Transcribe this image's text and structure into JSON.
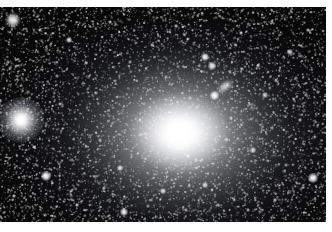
{
  "image": {
    "kind": "astronomical-photograph",
    "subject": "giant elliptical galaxy with surrounding star field",
    "alt_text": "Black-and-white astronomical photograph of a bright diffuse elliptical galaxy centered slightly right of middle, surrounded by a dense field of stars, with a small edge-on companion galaxy at upper right and a brilliant spiked foreground star at the left edge.",
    "width": 332,
    "height": 232,
    "border_color": "#ffffff",
    "sky_color": "#020203",
    "light_color": "#ffffff"
  },
  "frame": {
    "border_top": 7,
    "border_bottom": 10,
    "border_right": 6,
    "border_left": 0,
    "plate_left": 0,
    "plate_top": 7,
    "plate_width": 326,
    "plate_height": 215
  },
  "objects": {
    "galaxy": {
      "name": "central-elliptical-galaxy",
      "center_x_pct": 55.2,
      "center_y_pct": 58.6,
      "halo_rx_pct": 62,
      "halo_ry_pct": 68,
      "core_rx_pct": 15.5,
      "core_ry_pct": 19,
      "orientation": "horizontally elongated",
      "peak_brightness": "#ffffff"
    },
    "companion_galaxy": {
      "name": "edge-on-companion-galaxy",
      "x": 212,
      "y": 80,
      "width": 26,
      "height": 13,
      "rotation_deg": -38,
      "nucleus_x": 214,
      "nucleus_y": 95,
      "nucleus_size": 9
    },
    "spiked_star": {
      "name": "bright-foreground-star",
      "x": 21,
      "y": 120,
      "glow_size": 46,
      "spike_count": 16,
      "spike_length": 62
    }
  },
  "stars": [
    {
      "x": 13,
      "y": 20,
      "r": 5.4,
      "a": 0.98,
      "fuzzy": true
    },
    {
      "x": 46,
      "y": 176,
      "r": 4.2,
      "a": 1.0,
      "fuzzy": false
    },
    {
      "x": 313,
      "y": 178,
      "r": 3.8,
      "a": 0.98,
      "fuzzy": false
    },
    {
      "x": 124,
      "y": 212,
      "r": 3.4,
      "a": 0.95,
      "fuzzy": false
    },
    {
      "x": 205,
      "y": 57,
      "r": 3.2,
      "a": 0.96,
      "fuzzy": false
    },
    {
      "x": 212,
      "y": 66,
      "r": 2.8,
      "a": 0.9,
      "fuzzy": false
    },
    {
      "x": 69,
      "y": 40,
      "r": 2.4,
      "a": 0.86,
      "fuzzy": false
    },
    {
      "x": 40,
      "y": 30,
      "r": 1.7,
      "a": 0.72,
      "fuzzy": false
    },
    {
      "x": 120,
      "y": 168,
      "r": 2.6,
      "a": 0.88,
      "fuzzy": false
    },
    {
      "x": 163,
      "y": 191,
      "r": 2.3,
      "a": 0.84,
      "fuzzy": false
    },
    {
      "x": 205,
      "y": 185,
      "r": 2.2,
      "a": 0.82,
      "fuzzy": false
    },
    {
      "x": 253,
      "y": 150,
      "r": 2.0,
      "a": 0.8,
      "fuzzy": false
    },
    {
      "x": 265,
      "y": 95,
      "r": 2.0,
      "a": 0.78,
      "fuzzy": false
    },
    {
      "x": 290,
      "y": 52,
      "r": 2.1,
      "a": 0.8,
      "fuzzy": false
    },
    {
      "x": 241,
      "y": 33,
      "r": 1.9,
      "a": 0.76,
      "fuzzy": false
    },
    {
      "x": 176,
      "y": 26,
      "r": 1.8,
      "a": 0.74,
      "fuzzy": false
    },
    {
      "x": 110,
      "y": 22,
      "r": 1.7,
      "a": 0.72,
      "fuzzy": false
    },
    {
      "x": 86,
      "y": 63,
      "r": 1.6,
      "a": 0.7,
      "fuzzy": false
    },
    {
      "x": 60,
      "y": 104,
      "r": 1.6,
      "a": 0.68,
      "fuzzy": false
    },
    {
      "x": 34,
      "y": 147,
      "r": 1.7,
      "a": 0.7,
      "fuzzy": false
    },
    {
      "x": 14,
      "y": 196,
      "r": 1.9,
      "a": 0.74,
      "fuzzy": false
    },
    {
      "x": 77,
      "y": 205,
      "r": 1.8,
      "a": 0.72,
      "fuzzy": false
    },
    {
      "x": 140,
      "y": 120,
      "r": 1.5,
      "a": 0.62,
      "fuzzy": false
    },
    {
      "x": 231,
      "y": 118,
      "r": 1.5,
      "a": 0.62,
      "fuzzy": false
    },
    {
      "x": 196,
      "y": 160,
      "r": 1.6,
      "a": 0.66,
      "fuzzy": false
    },
    {
      "x": 275,
      "y": 200,
      "r": 1.8,
      "a": 0.7,
      "fuzzy": false
    },
    {
      "x": 300,
      "y": 120,
      "r": 1.7,
      "a": 0.68,
      "fuzzy": false
    },
    {
      "x": 308,
      "y": 30,
      "r": 1.8,
      "a": 0.7,
      "fuzzy": false
    },
    {
      "x": 152,
      "y": 45,
      "r": 1.5,
      "a": 0.64,
      "fuzzy": false
    },
    {
      "x": 100,
      "y": 140,
      "r": 1.4,
      "a": 0.58,
      "fuzzy": false
    },
    {
      "x": 248,
      "y": 210,
      "r": 1.6,
      "a": 0.66,
      "fuzzy": false
    },
    {
      "x": 186,
      "y": 210,
      "r": 1.5,
      "a": 0.62,
      "fuzzy": false
    },
    {
      "x": 57,
      "y": 76,
      "r": 1.4,
      "a": 0.58,
      "fuzzy": false
    },
    {
      "x": 218,
      "y": 205,
      "r": 1.4,
      "a": 0.58,
      "fuzzy": false
    },
    {
      "x": 286,
      "y": 165,
      "r": 1.4,
      "a": 0.58,
      "fuzzy": false
    },
    {
      "x": 130,
      "y": 62,
      "r": 1.3,
      "a": 0.55,
      "fuzzy": false
    },
    {
      "x": 96,
      "y": 93,
      "r": 1.3,
      "a": 0.54,
      "fuzzy": false
    },
    {
      "x": 166,
      "y": 77,
      "r": 1.3,
      "a": 0.52,
      "fuzzy": false
    },
    {
      "x": 258,
      "y": 66,
      "r": 1.3,
      "a": 0.54,
      "fuzzy": false
    },
    {
      "x": 318,
      "y": 92,
      "r": 1.4,
      "a": 0.58,
      "fuzzy": false
    },
    {
      "x": 8,
      "y": 62,
      "r": 1.3,
      "a": 0.54,
      "fuzzy": false
    },
    {
      "x": 28,
      "y": 92,
      "r": 1.2,
      "a": 0.5,
      "fuzzy": false
    },
    {
      "x": 45,
      "y": 215,
      "r": 1.4,
      "a": 0.56,
      "fuzzy": false
    },
    {
      "x": 104,
      "y": 188,
      "r": 1.3,
      "a": 0.54,
      "fuzzy": false
    },
    {
      "x": 226,
      "y": 140,
      "r": 1.2,
      "a": 0.48,
      "fuzzy": false
    },
    {
      "x": 148,
      "y": 206,
      "r": 1.3,
      "a": 0.52,
      "fuzzy": false
    },
    {
      "x": 272,
      "y": 128,
      "r": 1.2,
      "a": 0.48,
      "fuzzy": false
    },
    {
      "x": 190,
      "y": 98,
      "r": 1.2,
      "a": 0.46,
      "fuzzy": false
    },
    {
      "x": 72,
      "y": 160,
      "r": 1.2,
      "a": 0.48,
      "fuzzy": false
    },
    {
      "x": 296,
      "y": 78,
      "r": 1.2,
      "a": 0.48,
      "fuzzy": false
    }
  ]
}
